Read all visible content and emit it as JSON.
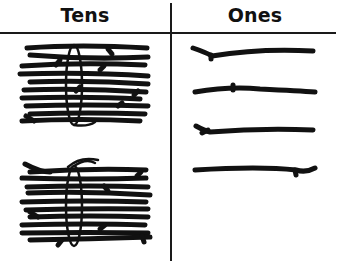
{
  "table": {
    "columns": [
      {
        "label": "Tens"
      },
      {
        "label": "Ones"
      }
    ]
  },
  "tens": {
    "bundles": 2,
    "sticks_per_bundle": 10,
    "icon": "stick-bundle-icon"
  },
  "ones": {
    "sticks": 4,
    "icon": "single-stick-icon"
  },
  "colors": {
    "ink": "#111111",
    "background": "#ffffff"
  }
}
